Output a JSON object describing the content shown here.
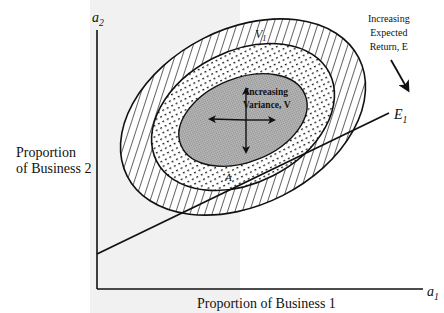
{
  "diagram": {
    "type": "iso-variance ellipses with iso-expected-return line",
    "axes": {
      "x_axis_symbol": "a",
      "x_axis_subscript": "1",
      "x_axis_label": "Proportion of Business 1",
      "y_axis_symbol": "a",
      "y_axis_subscript": "2",
      "y_axis_label_line1": "Proportion",
      "y_axis_label_line2": "of Business 2"
    },
    "ellipses": [
      {
        "name": "outer",
        "fill": "diagonal hatch"
      },
      {
        "name": "middle",
        "fill": "dotted"
      },
      {
        "name": "inner",
        "fill": "gray"
      }
    ],
    "labels": {
      "variance_contour_symbol": "V",
      "variance_contour_subscript": "1",
      "variance_line1": "Increasing",
      "variance_line2": "Variance, V",
      "return_line1": "Increasing",
      "return_line2": "Expected",
      "return_line3": "Return, E",
      "return_line_symbol": "E",
      "return_line_subscript": "1",
      "point_label": "A"
    },
    "colors": {
      "ink": "#111111",
      "inner_fill": "#a9a9a9",
      "background": "#ffffff",
      "paper_shade": "#f1f1f1"
    }
  }
}
